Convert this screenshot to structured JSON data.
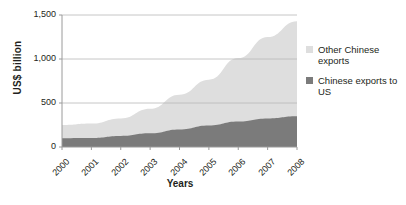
{
  "chart_data": {
    "type": "area",
    "stacked": true,
    "title": "",
    "xlabel": "Years",
    "ylabel": "US$ billion",
    "categories": [
      "2000",
      "2001",
      "2002",
      "2003",
      "2004",
      "2005",
      "2006",
      "2007",
      "2008"
    ],
    "x": [
      2000,
      2001,
      2002,
      2003,
      2004,
      2005,
      2006,
      2007,
      2008
    ],
    "series": [
      {
        "name": "Chinese exports to US",
        "color": "#7b7b7b",
        "values": [
          100,
          102,
          125,
          155,
          200,
          245,
          290,
          325,
          350
        ]
      },
      {
        "name": "Other Chinese exports",
        "color": "#dedede",
        "values": [
          150,
          165,
          200,
          280,
          395,
          520,
          720,
          925,
          1080
        ]
      }
    ],
    "totals": [
      250,
      267,
      325,
      435,
      595,
      765,
      1010,
      1250,
      1430
    ],
    "ylim": [
      0,
      1500
    ],
    "yticks": [
      0,
      500,
      1000,
      1500
    ],
    "ytick_labels": [
      "0",
      "500",
      "1,000",
      "1,500"
    ],
    "grid": true,
    "legend_position": "right"
  },
  "legend": {
    "items": [
      {
        "label": "Other Chinese exports",
        "color": "#dedede"
      },
      {
        "label": "Chinese exports to US",
        "color": "#7b7b7b"
      }
    ]
  },
  "axes": {
    "y_title": "US$ billion",
    "x_title": "Years"
  }
}
